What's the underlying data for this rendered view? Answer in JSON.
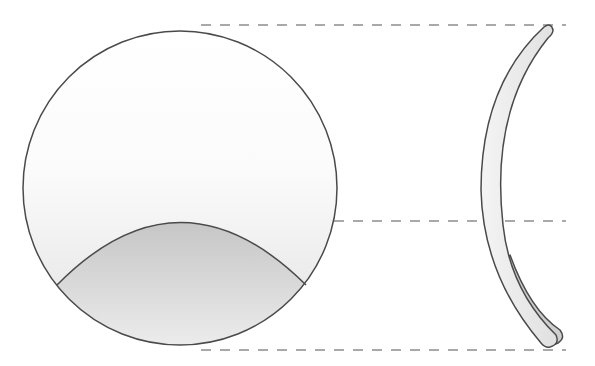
{
  "diagram": {
    "title": "",
    "colors": {
      "outline": "#4a4a4a",
      "dash": "#555555",
      "lens_fill_top": "#ffffff",
      "lens_fill_bottom": "#e6e6e6",
      "segment_fill_top": "#c9c9c9",
      "segment_fill_bottom": "#f0f0f0",
      "profile_fill": "#ececec",
      "profile_segment_fill": "#cfcfcf"
    },
    "elements": [
      {
        "name": "front-view-lens",
        "shape": "circle",
        "cx": 180,
        "cy": 188,
        "r": 157
      },
      {
        "name": "lens-segment",
        "shape": "arc-region",
        "apex_y": 221,
        "left_x": 57,
        "right_x": 306,
        "join_y": 285
      },
      {
        "name": "side-profile-lens",
        "shape": "crescent"
      },
      {
        "name": "alignment-line-top",
        "y": 25
      },
      {
        "name": "alignment-line-middle",
        "y": 221
      },
      {
        "name": "alignment-line-bottom",
        "y": 349
      }
    ]
  }
}
